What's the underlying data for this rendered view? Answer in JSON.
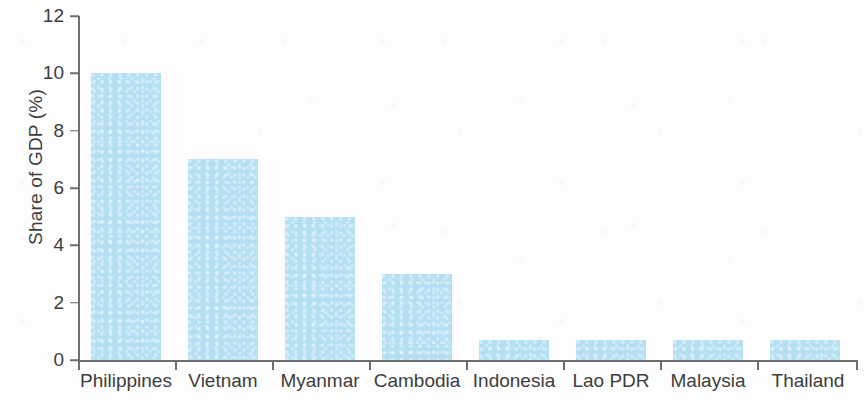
{
  "chart_data": {
    "type": "bar",
    "title": "",
    "subtitle": "",
    "xlabel": "",
    "ylabel": "Share of GDP (%)",
    "categories": [
      "Philippines",
      "Vietnam",
      "Myanmar",
      "Cambodia",
      "Indonesia",
      "Lao PDR",
      "Malaysia",
      "Thailand"
    ],
    "values": [
      10,
      7,
      5,
      3,
      0.7,
      0.7,
      0.7,
      0.7
    ],
    "ylim": [
      0,
      12
    ],
    "ytick_labels": [
      "0",
      "2",
      "4",
      "6",
      "8",
      "10",
      "12"
    ],
    "ytick_values": [
      0,
      2,
      4,
      6,
      8,
      10,
      12
    ],
    "grid": false,
    "legend": null,
    "annotations": [],
    "bar_color": "#b5e0f4",
    "axis_color": "#6e6e6e",
    "text_color": "#3d3d3d",
    "background_color": "#ffffff"
  }
}
